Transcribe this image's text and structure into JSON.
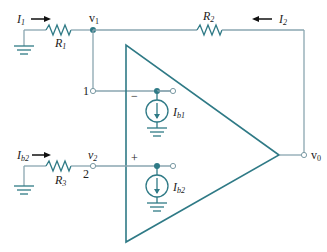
{
  "diagram": {
    "labels": {
      "I1": {
        "main": "I",
        "sub": "1"
      },
      "I2": {
        "main": "I",
        "sub": "2"
      },
      "R1": {
        "main": "R",
        "sub": "1"
      },
      "R2": {
        "main": "R",
        "sub": "2"
      },
      "R3": {
        "main": "R",
        "sub": "3"
      },
      "v1": {
        "main": "v",
        "sub": "1"
      },
      "v2": {
        "main": "v",
        "sub": "2"
      },
      "v0": {
        "main": "v",
        "sub": "0"
      },
      "Ib1": {
        "main": "I",
        "sub": "b1"
      },
      "Ib2": {
        "main": "I",
        "sub": "b2"
      },
      "Ib2_in": {
        "main": "I",
        "sub": "b2"
      },
      "node1": "1",
      "node2": "2",
      "minus": "−",
      "plus": "+"
    },
    "colors": {
      "wire": "#8aa6b0",
      "component": "#2f7a86"
    }
  }
}
